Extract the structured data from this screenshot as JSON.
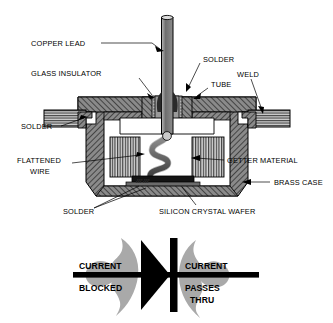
{
  "figure": {
    "type": "technical-cross-section-diagram",
    "background_color": "#ffffff",
    "ink_color": "#000000"
  },
  "callouts": [
    {
      "id": "copper-lead",
      "text": "COPPER LEAD",
      "side": "left"
    },
    {
      "id": "solder-top",
      "text": "SOLDER",
      "side": "right"
    },
    {
      "id": "glass-insulator",
      "text": "GLASS INSULATOR",
      "side": "left"
    },
    {
      "id": "tube",
      "text": "TUBE",
      "side": "right"
    },
    {
      "id": "weld",
      "text": "WELD",
      "side": "right"
    },
    {
      "id": "solder-left",
      "text": "SOLDER",
      "side": "left"
    },
    {
      "id": "flattened-wire",
      "text": "FLATTENED",
      "side": "left"
    },
    {
      "id": "flattened-wire-2",
      "text": "WIRE",
      "side": "left"
    },
    {
      "id": "getter-material",
      "text": "GETTER MATERIAL",
      "side": "right"
    },
    {
      "id": "brass-case",
      "text": "BRASS CASE",
      "side": "right"
    },
    {
      "id": "solder-bottom",
      "text": "SOLDER",
      "side": "left"
    },
    {
      "id": "silicon-crystal-wafer",
      "text": "SILICON CRYSTAL WAFER",
      "side": "right"
    }
  ],
  "symbol": {
    "name": "diode-schematic-symbol",
    "left_line_1": "CURRENT",
    "left_line_2": "BLOCKED",
    "right_line_1": "CURRENT",
    "right_line_2": "PASSES",
    "right_line_3": "THRU",
    "arrow_fill": "#a8a8a8",
    "symbol_fill": "#000000"
  },
  "materials": {
    "brass_case_hatch": "#6e6e6e",
    "glass_insulator": "#8c8c8c",
    "copper_lead": "#808080",
    "getter_stripe": "#5a5a5a",
    "weld_block": "#6a6a6a",
    "solder_block": "#707070",
    "cavity_white": "#ffffff",
    "wafer_dark": "#1c1c1c"
  }
}
